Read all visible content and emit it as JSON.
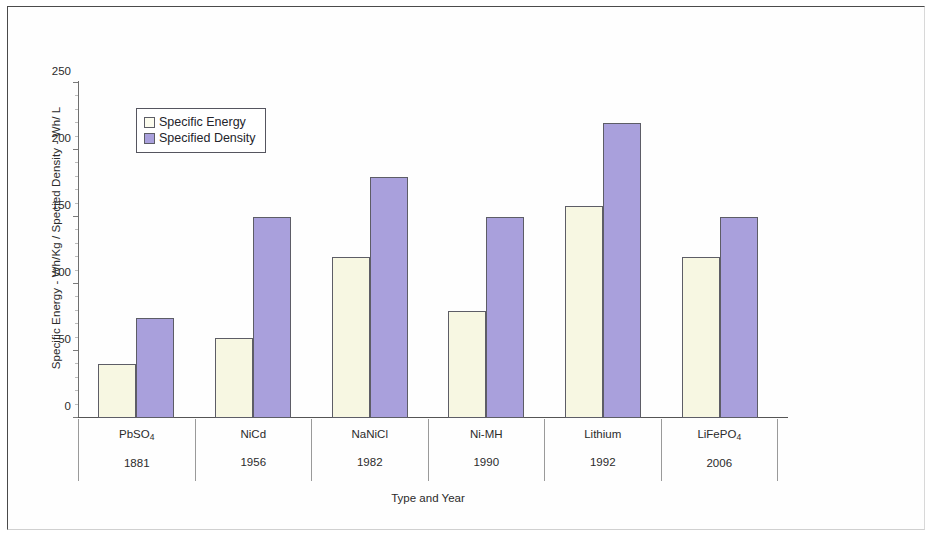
{
  "frame": {
    "border_color": "#4a4a4a"
  },
  "chart_data": {
    "type": "bar",
    "title": "",
    "xlabel": "Type and Year",
    "ylabel": "Specific Energy - Wh/Kg / Specied Density - Wh/ L",
    "ylim": [
      0,
      250
    ],
    "yticks": [
      0,
      50,
      100,
      150,
      200,
      250
    ],
    "grid": false,
    "legend_position": "upper-left-inside",
    "categories": [
      "PbSO4",
      "NiCd",
      "NaNiCl",
      "Ni-MH",
      "Lithium",
      "LiFePO4"
    ],
    "category_labels": [
      {
        "name": "PbSO",
        "sub": "4",
        "year": "1881"
      },
      {
        "name": "NiCd",
        "sub": "",
        "year": "1956"
      },
      {
        "name": "NaNiCl",
        "sub": "",
        "year": "1982"
      },
      {
        "name": "Ni-MH",
        "sub": "",
        "year": "1990"
      },
      {
        "name": "Lithium",
        "sub": "",
        "year": "1992"
      },
      {
        "name": "LiFePO",
        "sub": "4",
        "year": "2006"
      }
    ],
    "series": [
      {
        "name": "Specific Energy",
        "color": "#f7f7e2",
        "values": [
          40,
          60,
          120,
          80,
          158,
          120
        ]
      },
      {
        "name": "Specified Density",
        "color": "#a9a0dc",
        "values": [
          75,
          150,
          180,
          150,
          220,
          150
        ]
      }
    ]
  },
  "legend": {
    "entries": [
      {
        "label": "Specific Energy",
        "swatch": "energy"
      },
      {
        "label": "Specified Density",
        "swatch": "density"
      }
    ]
  }
}
